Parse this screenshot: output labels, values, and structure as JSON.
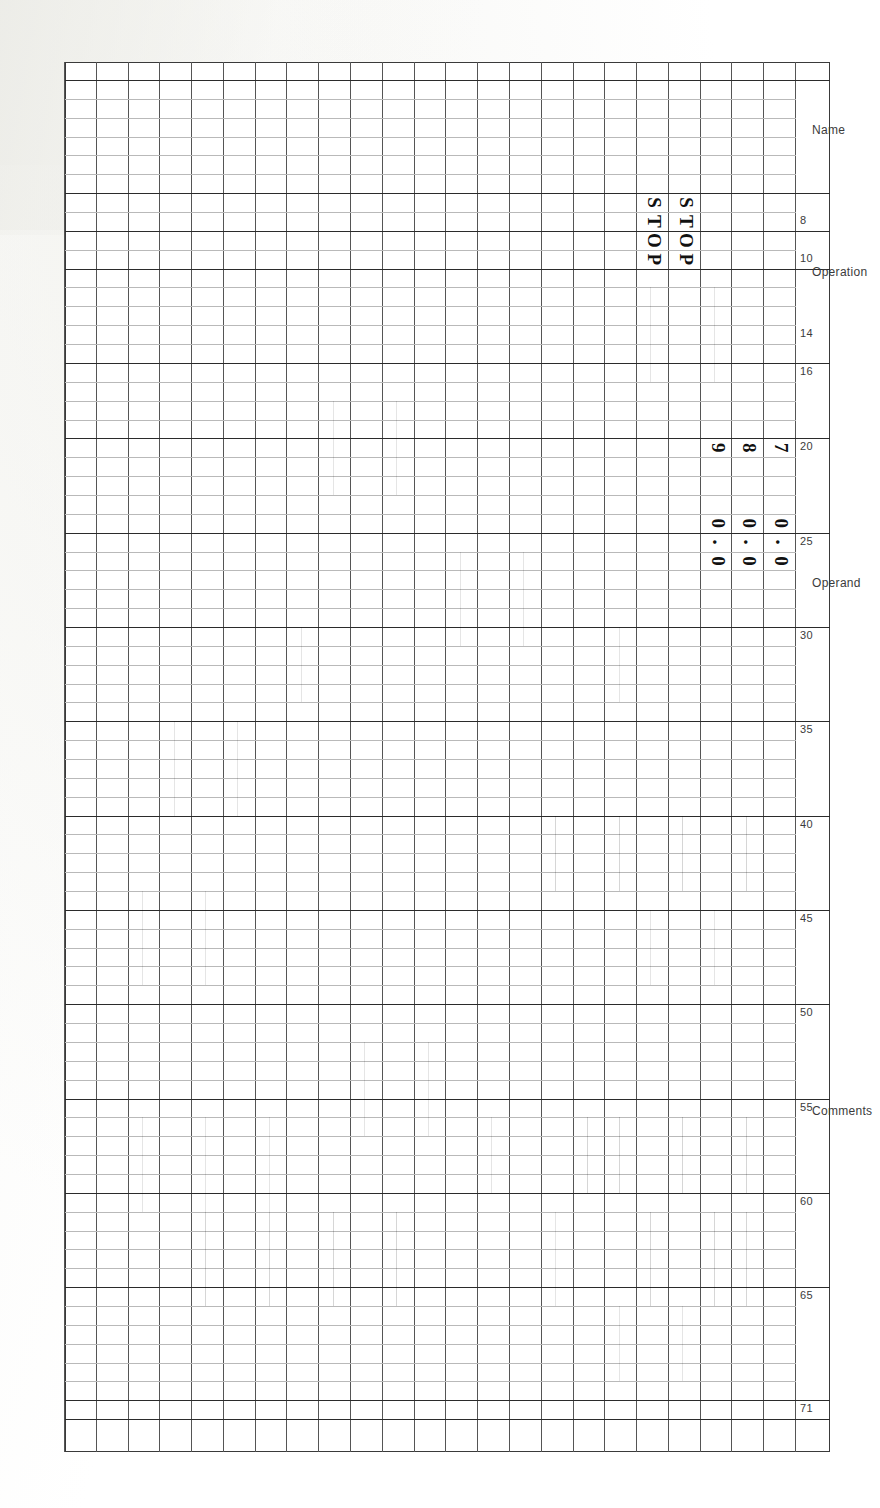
{
  "document": {
    "kind": "punched-card-coding-form",
    "orientation": "rotated-90-ccw",
    "background_color": "#ffffff",
    "ink_color": "#2e2e2e"
  },
  "form": {
    "section_labels": [
      {
        "text": "Name",
        "column_start": 1,
        "column_end": 6
      },
      {
        "text": "Operation",
        "column_start": 7,
        "column_end": 15
      },
      {
        "text": "Operand",
        "column_start": 16,
        "column_end": 39
      },
      {
        "text": "Comments",
        "column_start": 40,
        "column_end": 71
      }
    ],
    "column_numbers": [
      8,
      10,
      14,
      16,
      20,
      25,
      30,
      35,
      40,
      45,
      50,
      55,
      60,
      65,
      71
    ],
    "major_column_rules": [
      1,
      7,
      9,
      11,
      16,
      20,
      25,
      30,
      35,
      40,
      45,
      50,
      55,
      60,
      65,
      71
    ],
    "line_count": 23,
    "card_columns": 72
  },
  "entries": [
    {
      "line": 1,
      "cells": [
        {
          "column": 20,
          "text": "7"
        },
        {
          "column": 24,
          "text": "0"
        },
        {
          "column": 25,
          "text": "."
        },
        {
          "column": 26,
          "text": "0"
        }
      ]
    },
    {
      "line": 2,
      "cells": [
        {
          "column": 20,
          "text": "8"
        },
        {
          "column": 24,
          "text": "0"
        },
        {
          "column": 25,
          "text": "."
        },
        {
          "column": 26,
          "text": "0"
        }
      ]
    },
    {
      "line": 3,
      "cells": [
        {
          "column": 20,
          "text": "9"
        },
        {
          "column": 24,
          "text": "0"
        },
        {
          "column": 25,
          "text": "."
        },
        {
          "column": 26,
          "text": "0"
        }
      ]
    },
    {
      "line": 4,
      "cells": [
        {
          "column": 7,
          "text": "S"
        },
        {
          "column": 8,
          "text": "T"
        },
        {
          "column": 9,
          "text": "O"
        },
        {
          "column": 10,
          "text": "P"
        }
      ]
    },
    {
      "line": 5,
      "cells": [
        {
          "column": 7,
          "text": "S"
        },
        {
          "column": 8,
          "text": "T"
        },
        {
          "column": 9,
          "text": "O"
        },
        {
          "column": 10,
          "text": "P"
        }
      ]
    }
  ],
  "entry_text": {
    "line1": "7      0.0",
    "line2": "8      0.0",
    "line3": "9      0.0",
    "line4": "STOP",
    "line5": "STOP"
  }
}
